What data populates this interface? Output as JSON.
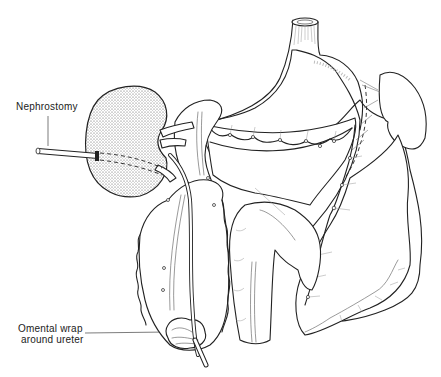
{
  "figure": {
    "type": "surgical illustration",
    "labels": {
      "nephrostomy": "Nephrostomy",
      "omental_wrap_line1": "Omental wrap",
      "omental_wrap_line2": "around ureter"
    },
    "structures": [
      "kidney",
      "nephrostomy tube",
      "ureter",
      "omentum",
      "stomach",
      "esophagus",
      "spleen",
      "colon",
      "anastomosis sutures"
    ]
  }
}
